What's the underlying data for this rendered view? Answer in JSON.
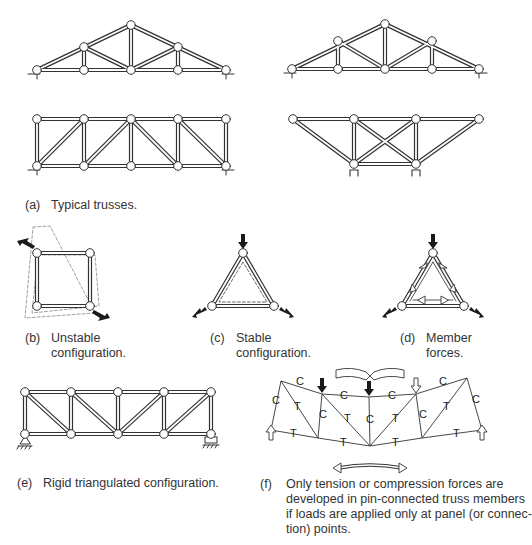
{
  "figure": {
    "panels": [
      {
        "id": "a",
        "tag": "(a)",
        "caption_lines": [
          "Typical trusses."
        ]
      },
      {
        "id": "b",
        "tag": "(b)",
        "caption_lines": [
          "Unstable",
          "configuration."
        ]
      },
      {
        "id": "c",
        "tag": "(c)",
        "caption_lines": [
          "Stable",
          "configuration."
        ]
      },
      {
        "id": "d",
        "tag": "(d)",
        "caption_lines": [
          "Member",
          "forces."
        ]
      },
      {
        "id": "e",
        "tag": "(e)",
        "caption_lines": [
          "Rigid triangulated configuration."
        ]
      },
      {
        "id": "f",
        "tag": "(f)",
        "caption_lines": [
          "Only tension or compression forces are",
          "developed in pin-connected truss members",
          "if loads are applied only at panel (or connec-",
          "tion) points."
        ]
      }
    ],
    "member_labels": {
      "compression": "C",
      "tension": "T"
    },
    "colors": {
      "line": "#333333",
      "arrow_fill": "#1a1a1a",
      "dashed": "#777777"
    }
  }
}
